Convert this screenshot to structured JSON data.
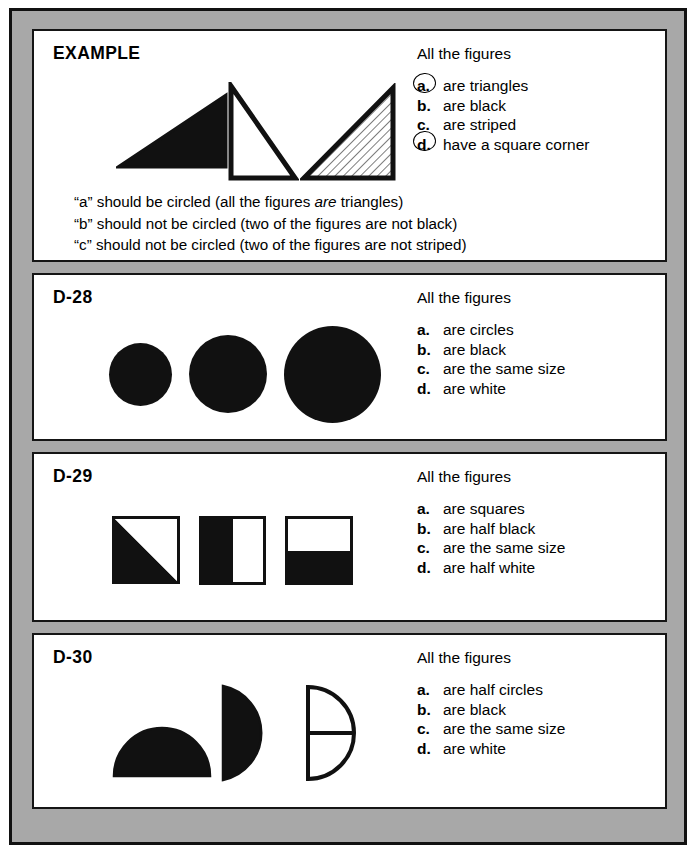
{
  "worksheet": {
    "frame_color": "#a8a8a8",
    "border_color": "#111111",
    "ink_color": "#111111",
    "page_background": "#ffffff"
  },
  "panels": [
    {
      "id": "example",
      "label": "EXAMPLE",
      "heading": "All the figures",
      "statements": [
        {
          "letter": "a.",
          "letter_plain": "a",
          "text": "are triangles",
          "circled": true
        },
        {
          "letter": "b.",
          "letter_plain": "b",
          "text": "are black",
          "circled": false
        },
        {
          "letter": "c.",
          "letter_plain": "c",
          "text": "are striped",
          "circled": false
        },
        {
          "letter": "d.",
          "letter_plain": "d",
          "text": "have a square corner",
          "circled": true
        }
      ],
      "figures": [
        {
          "shape": "triangle",
          "fill": "black",
          "right_angle": "bottom-right"
        },
        {
          "shape": "triangle",
          "fill": "white",
          "right_angle": "bottom-left"
        },
        {
          "shape": "triangle",
          "fill": "striped",
          "right_angle": "bottom-right"
        }
      ],
      "explanations": [
        {
          "pre": "“a” should be circled (all the figures ",
          "emph": "are",
          "post": " triangles)"
        },
        {
          "pre": "“b” should not be circled (two of the figures are not black)",
          "emph": "",
          "post": ""
        },
        {
          "pre": "“c” should not be circled (two of the figures are not striped)",
          "emph": "",
          "post": ""
        },
        {
          "pre": "“d” should be circled (all of the figures ",
          "emph": "have",
          "post": " a square corner)"
        }
      ]
    },
    {
      "id": "d28",
      "label": "D-28",
      "heading": "All the figures",
      "statements": [
        {
          "letter": "a.",
          "letter_plain": "a",
          "text": "are circles",
          "circled": false
        },
        {
          "letter": "b.",
          "letter_plain": "b",
          "text": "are black",
          "circled": false
        },
        {
          "letter": "c.",
          "letter_plain": "c",
          "text": "are the same size",
          "circled": false
        },
        {
          "letter": "d.",
          "letter_plain": "d",
          "text": "are white",
          "circled": false
        }
      ],
      "figures": [
        {
          "shape": "circle",
          "fill": "black",
          "size": "small"
        },
        {
          "shape": "circle",
          "fill": "black",
          "size": "medium"
        },
        {
          "shape": "circle",
          "fill": "black",
          "size": "large"
        }
      ]
    },
    {
      "id": "d29",
      "label": "D-29",
      "heading": "All the figures",
      "statements": [
        {
          "letter": "a.",
          "letter_plain": "a",
          "text": "are squares",
          "circled": false
        },
        {
          "letter": "b.",
          "letter_plain": "b",
          "text": "are half black",
          "circled": false
        },
        {
          "letter": "c.",
          "letter_plain": "c",
          "text": "are the same size",
          "circled": false
        },
        {
          "letter": "d.",
          "letter_plain": "d",
          "text": "are half white",
          "circled": false
        }
      ],
      "figures": [
        {
          "shape": "square",
          "fill": "half-black-diagonal"
        },
        {
          "shape": "square",
          "fill": "half-black-left"
        },
        {
          "shape": "square",
          "fill": "half-black-bottom"
        }
      ]
    },
    {
      "id": "d30",
      "label": "D-30",
      "heading": "All the figures",
      "statements": [
        {
          "letter": "a.",
          "letter_plain": "a",
          "text": "are half circles",
          "circled": false
        },
        {
          "letter": "b.",
          "letter_plain": "b",
          "text": "are black",
          "circled": false
        },
        {
          "letter": "c.",
          "letter_plain": "c",
          "text": "are the same size",
          "circled": false
        },
        {
          "letter": "d.",
          "letter_plain": "d",
          "text": "are white",
          "circled": false
        }
      ],
      "figures": [
        {
          "shape": "half-circle",
          "fill": "black",
          "orientation": "flat-bottom"
        },
        {
          "shape": "half-circle",
          "fill": "black",
          "orientation": "flat-left"
        },
        {
          "shape": "half-circle",
          "fill": "white",
          "orientation": "flat-left",
          "divided": true
        }
      ]
    }
  ]
}
